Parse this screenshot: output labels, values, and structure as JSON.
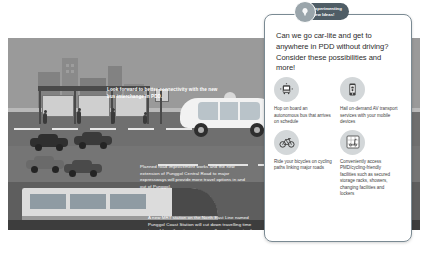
{
  "badge": {
    "line1": "Experimenting",
    "line2": "New Ideas!",
    "icon": "lightbulb-icon",
    "color": "#4f5d66"
  },
  "card": {
    "headline": "Can we go car-lite and get to anywhere in PDD without driving? Consider these possibilities and more!",
    "features": [
      {
        "icon": "bus-icon",
        "text": "Hop on board an autonomous bus that arrives on schedule"
      },
      {
        "icon": "mobile-phone-icon",
        "text": "Hail on-demand AV transport services with your mobile devices"
      },
      {
        "icon": "bicycle-icon",
        "text": "Ride your bicycles on cycling paths linking major roads"
      },
      {
        "icon": "scooter-locker-icon",
        "text": "Conveniently access PMD/cycling-friendly facilities such as secured storage racks, showers, changing facilities and lockers"
      }
    ]
  },
  "illustration": {
    "captions": [
      {
        "name": "bus-interchange-caption",
        "text": "Look forward to better connectivity with the new bus interchange in PDD."
      },
      {
        "name": "road-improvement-caption",
        "text": "Planned road improvement works and the new extension of Punggol Central Road to major expressways will provide more travel options in and out of Punggol."
      },
      {
        "name": "mrt-station-caption",
        "text": "A new MRT station on the North East Line named Punggol Coast Station will cut down travelling time to and from the city centre as well as other parts of Singapore by up to 15 minutes."
      }
    ],
    "colors": {
      "sky": "#9a9a9a",
      "road": "#6f6f6f",
      "lower": "#5e5e5e",
      "vehicle": "#f2f2f2"
    }
  }
}
